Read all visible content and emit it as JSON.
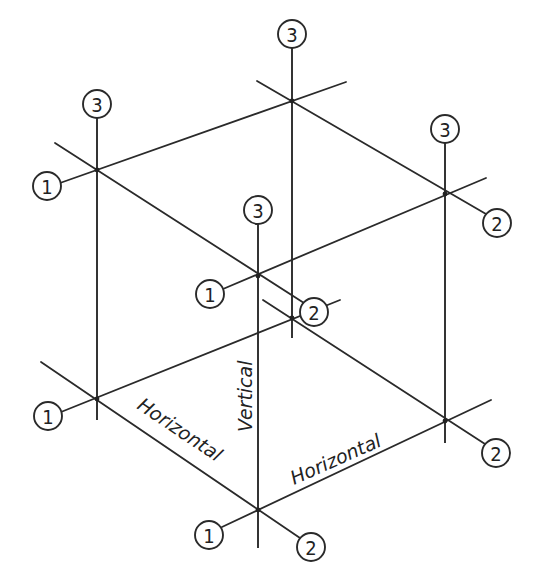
{
  "diagram": {
    "type": "isometric-axis-diagram",
    "colors": {
      "line": "#2a2a2a",
      "background": "#ffffff",
      "text": "#222222"
    },
    "labels": {
      "horizontal_left": "Horizontal",
      "horizontal_right": "Horizontal",
      "vertical": "Vertical"
    },
    "markers": [
      {
        "id": "tl-3",
        "value": "3"
      },
      {
        "id": "tl-1",
        "value": "1"
      },
      {
        "id": "tb-3",
        "value": "3"
      },
      {
        "id": "tr-3",
        "value": "3"
      },
      {
        "id": "tr-2",
        "value": "2"
      },
      {
        "id": "tf-3",
        "value": "3"
      },
      {
        "id": "tf-1",
        "value": "1"
      },
      {
        "id": "bb-2",
        "value": "2"
      },
      {
        "id": "bl-1",
        "value": "1"
      },
      {
        "id": "br-2",
        "value": "2"
      },
      {
        "id": "bf-1",
        "value": "1"
      },
      {
        "id": "bf-2",
        "value": "2"
      }
    ]
  }
}
